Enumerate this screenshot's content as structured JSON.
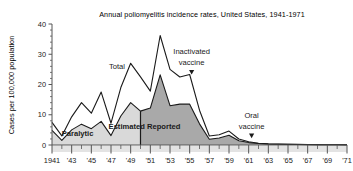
{
  "chart_data": {
    "type": "area",
    "title": "Annual poliomyelitis incidence rates, United States, 1941-1971",
    "xlabel": "",
    "ylabel": "Cases per 100,000 population",
    "xlim": [
      1941,
      1971
    ],
    "ylim": [
      0,
      40
    ],
    "yticks": [
      0,
      10,
      20,
      30,
      40
    ],
    "ytick_labels": [
      "0",
      "10",
      "20",
      "30",
      "40"
    ],
    "xticks": [
      1941,
      1943,
      1945,
      1947,
      1949,
      1951,
      1953,
      1955,
      1957,
      1959,
      1961,
      1963,
      1965,
      1967,
      1969,
      1971
    ],
    "xtick_labels": [
      "1941",
      "'43",
      "'45",
      "'47",
      "'49",
      "'51",
      "'53",
      "'55",
      "'57",
      "'59",
      "'61",
      "'63",
      "'65",
      "'67",
      "'69",
      "'71"
    ],
    "grid": false,
    "legend_position": "inline-annotations",
    "x": [
      1941,
      1942,
      1943,
      1944,
      1945,
      1946,
      1947,
      1948,
      1949,
      1950,
      1951,
      1952,
      1953,
      1954,
      1955,
      1956,
      1957,
      1958,
      1959,
      1960,
      1961,
      1962,
      1963,
      1964,
      1965,
      1966,
      1967,
      1968,
      1969,
      1970,
      1971
    ],
    "series": [
      {
        "name": "Total",
        "values": [
          7.5,
          3.0,
          9.3,
          14.0,
          10.5,
          17.5,
          7.2,
          19.0,
          27.0,
          22.5,
          17.8,
          36.2,
          25.0,
          22.5,
          23.3,
          11.5,
          3.0,
          3.4,
          4.6,
          2.0,
          1.1,
          0.6,
          0.4,
          0.3,
          0.25,
          0.2,
          0.15,
          0.12,
          0.1,
          0.08,
          0.06
        ]
      },
      {
        "name": "Paralytic / Estimated Reported",
        "values": [
          4.8,
          1.5,
          5.0,
          6.9,
          5.4,
          7.8,
          3.1,
          9.6,
          14.0,
          11.2,
          12.2,
          23.2,
          13.0,
          13.5,
          13.5,
          7.0,
          1.9,
          2.3,
          3.2,
          1.4,
          0.8,
          0.5,
          0.3,
          0.25,
          0.2,
          0.15,
          0.12,
          0.1,
          0.08,
          0.06,
          0.05
        ]
      }
    ],
    "annotations": [
      {
        "text": "Total",
        "x": 1947.6,
        "y": 25.0,
        "type": "series-label"
      },
      {
        "text": "Paralytic",
        "x": 1943.6,
        "y": 3.1,
        "type": "band-label"
      },
      {
        "text": "Estimated Reported",
        "x": 1950.4,
        "y": 5.4,
        "type": "band-label"
      },
      {
        "text": "Inactivated",
        "x": 1955.2,
        "y": 30.0,
        "type": "event-label"
      },
      {
        "text": "vaccine",
        "x": 1955.2,
        "y": 26.4,
        "type": "event-label"
      },
      {
        "text": "Oral",
        "x": 1961.3,
        "y": 9.0,
        "type": "event-label"
      },
      {
        "text": "vaccine",
        "x": 1961.3,
        "y": 5.4,
        "type": "event-label"
      }
    ],
    "event_markers": [
      {
        "label": "Inactivated vaccine",
        "x": 1955.2,
        "marker": "down-triangle"
      },
      {
        "label": "Oral vaccine",
        "x": 1961.3,
        "marker": "down-triangle"
      }
    ],
    "split_year": 1950,
    "colors": {
      "estimated_fill": "#d9d9d9",
      "reported_fill": "#a9a9a9",
      "total_fill": "#ffffff",
      "line": "#1a1a1a",
      "axis": "#555555",
      "baseline_band": "#e3e3e3",
      "text": "#1a1a1a"
    }
  }
}
